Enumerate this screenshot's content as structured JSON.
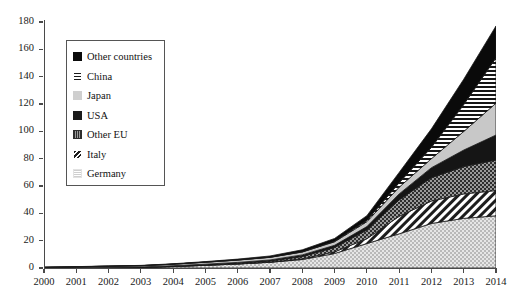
{
  "chart_data": {
    "type": "area",
    "stacked": true,
    "title": "",
    "xlabel": "",
    "ylabel": "",
    "x": [
      2000,
      2001,
      2002,
      2003,
      2004,
      2005,
      2006,
      2007,
      2008,
      2009,
      2010,
      2011,
      2012,
      2013,
      2014
    ],
    "categories": [
      "2000",
      "2001",
      "2002",
      "2003",
      "2004",
      "2005",
      "2006",
      "2007",
      "2008",
      "2009",
      "2010",
      "2011",
      "2012",
      "2013",
      "2014"
    ],
    "xlim": [
      2000,
      2014
    ],
    "ylim": [
      0,
      180
    ],
    "ytick_values": [
      0,
      20,
      40,
      60,
      80,
      100,
      120,
      140,
      160,
      180
    ],
    "ytick_labels": [
      "0",
      "20",
      "40",
      "60",
      "80",
      "100",
      "120",
      "140",
      "160",
      "180"
    ],
    "grid": false,
    "legend_position": "upper-left-inside",
    "stack_order_bottom_to_top": [
      "Germany",
      "Italy",
      "Other EU",
      "USA",
      "Japan",
      "China",
      "Other countries"
    ],
    "series": [
      {
        "name": "Germany",
        "pattern": "light-dots",
        "color": "#d0d0d0",
        "values": [
          0.1,
          0.2,
          0.3,
          0.4,
          1.1,
          2.0,
          2.9,
          4.2,
          6.2,
          10.6,
          17.9,
          25.0,
          32.6,
          36.3,
          38.2
        ]
      },
      {
        "name": "Italy",
        "pattern": "diagonal-stripes",
        "color": "#e8e8e8",
        "values": [
          0.0,
          0.0,
          0.0,
          0.0,
          0.0,
          0.0,
          0.1,
          0.1,
          0.5,
          1.2,
          3.5,
          12.8,
          16.4,
          17.9,
          18.5
        ]
      },
      {
        "name": "Other EU",
        "pattern": "dark-checker",
        "color": "#3a3a3a",
        "values": [
          0.0,
          0.0,
          0.1,
          0.1,
          0.2,
          0.3,
          0.5,
          0.8,
          1.7,
          3.2,
          6.4,
          12.0,
          17.1,
          20.0,
          22.3
        ]
      },
      {
        "name": "USA",
        "pattern": "solid-black",
        "color": "#151515",
        "values": [
          0.1,
          0.2,
          0.2,
          0.3,
          0.4,
          0.5,
          0.6,
          0.8,
          1.2,
          1.6,
          2.5,
          4.4,
          7.3,
          12.1,
          18.3
        ]
      },
      {
        "name": "Japan",
        "pattern": "light-gray",
        "color": "#c8c8c8",
        "values": [
          0.3,
          0.5,
          0.7,
          0.9,
          1.1,
          1.4,
          1.7,
          1.9,
          2.1,
          2.6,
          3.6,
          4.9,
          6.6,
          13.6,
          23.3
        ]
      },
      {
        "name": "China",
        "pattern": "horizontal-lines",
        "color": "#ffffff",
        "values": [
          0.0,
          0.0,
          0.0,
          0.0,
          0.0,
          0.1,
          0.1,
          0.1,
          0.2,
          0.4,
          0.9,
          3.3,
          8.3,
          19.7,
          33.2
        ]
      },
      {
        "name": "Other countries",
        "pattern": "solid-black",
        "color": "#090909",
        "values": [
          0.1,
          0.1,
          0.2,
          0.2,
          0.3,
          0.4,
          0.6,
          0.9,
          1.4,
          2.0,
          3.5,
          7.5,
          13.5,
          18.5,
          23.3
        ]
      }
    ],
    "totals": [
      0.6,
      1.0,
      1.5,
      1.9,
      3.1,
      4.7,
      6.5,
      8.8,
      13.3,
      21.6,
      38.3,
      69.9,
      101.8,
      138.1,
      177.1
    ]
  },
  "legend": {
    "items": [
      {
        "label": "Other countries"
      },
      {
        "label": "China"
      },
      {
        "label": "Japan"
      },
      {
        "label": "USA"
      },
      {
        "label": "Other EU"
      },
      {
        "label": "Italy"
      },
      {
        "label": "Germany"
      }
    ]
  }
}
